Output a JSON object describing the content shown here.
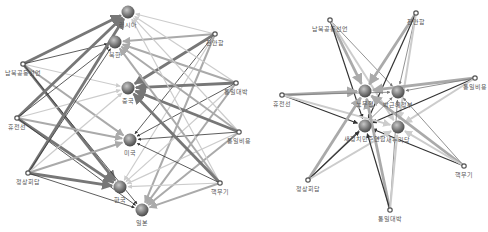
{
  "panels": [
    {
      "name": "left-network",
      "nodes": [
        {
          "id": "러시아",
          "x": 128,
          "y": 12,
          "big": true
        },
        {
          "id": "북한",
          "x": 115,
          "y": 42,
          "big": true
        },
        {
          "id": "중국",
          "x": 128,
          "y": 88,
          "big": true
        },
        {
          "id": "미국",
          "x": 130,
          "y": 140,
          "big": true
        },
        {
          "id": "한국",
          "x": 120,
          "y": 187,
          "big": true
        },
        {
          "id": "일본",
          "x": 142,
          "y": 210,
          "big": true
        },
        {
          "id": "천안함",
          "x": 215,
          "y": 34,
          "big": false
        },
        {
          "id": "남북공동선언",
          "x": 23,
          "y": 64,
          "big": false
        },
        {
          "id": "통일대박",
          "x": 236,
          "y": 83,
          "big": false
        },
        {
          "id": "휴전선",
          "x": 17,
          "y": 118,
          "big": false
        },
        {
          "id": "통일비용",
          "x": 239,
          "y": 132,
          "big": false
        },
        {
          "id": "정상회담",
          "x": 28,
          "y": 173,
          "big": false
        },
        {
          "id": "핵무기",
          "x": 220,
          "y": 183,
          "big": false
        }
      ]
    },
    {
      "name": "right-network",
      "nodes": [
        {
          "id": "노무현",
          "x": 365,
          "y": 91,
          "big": true
        },
        {
          "id": "박근혜정부",
          "x": 398,
          "y": 92,
          "big": true
        },
        {
          "id": "새정치민주연합",
          "x": 365,
          "y": 126,
          "big": true
        },
        {
          "id": "새누리당",
          "x": 398,
          "y": 127,
          "big": true
        },
        {
          "id": "남북공동선언",
          "x": 330,
          "y": 20,
          "big": false
        },
        {
          "id": "천안함",
          "x": 416,
          "y": 13,
          "big": false
        },
        {
          "id": "통일비용",
          "x": 475,
          "y": 78,
          "big": false
        },
        {
          "id": "휴전선",
          "x": 282,
          "y": 95,
          "big": false
        },
        {
          "id": "핵무기",
          "x": 464,
          "y": 166,
          "big": false
        },
        {
          "id": "정상회담",
          "x": 308,
          "y": 180,
          "big": false
        },
        {
          "id": "통일대박",
          "x": 390,
          "y": 210,
          "big": false
        }
      ]
    }
  ],
  "edge_colors": [
    "#333333",
    "#777777",
    "#aaaaaa",
    "#cccccc"
  ]
}
